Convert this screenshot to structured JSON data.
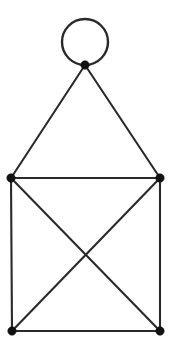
{
  "figure": {
    "width": 173,
    "height": 349,
    "background_color": "#ffffff",
    "edge_color": "#2a2a2a",
    "vertex_color": "#111111",
    "edge_stroke_width": 2.1,
    "vertex_radius": 4.2
  },
  "graph_data": {
    "type": "diagram",
    "directed": false,
    "has_self_loop": true,
    "vertex_count": 5,
    "edge_count": 9,
    "vertices": [
      {
        "id": "apex",
        "label": "",
        "x": 85,
        "y": 65,
        "degree": 4
      },
      {
        "id": "middle-left",
        "label": "",
        "x": 11,
        "y": 178,
        "degree": 4
      },
      {
        "id": "middle-right",
        "label": "",
        "x": 160,
        "y": 178,
        "degree": 4
      },
      {
        "id": "bottom-left",
        "label": "",
        "x": 12,
        "y": 331,
        "degree": 3
      },
      {
        "id": "bottom-right",
        "label": "",
        "x": 160,
        "y": 331,
        "degree": 3
      }
    ],
    "edges": [
      {
        "id": "edge-apex-middle-left",
        "from": "apex",
        "to": "middle-left",
        "x1": 85,
        "y1": 65,
        "x2": 11,
        "y2": 178
      },
      {
        "id": "edge-apex-middle-right",
        "from": "apex",
        "to": "middle-right",
        "x1": 85,
        "y1": 65,
        "x2": 160,
        "y2": 178
      },
      {
        "id": "edge-middle-left-middle-right",
        "from": "middle-left",
        "to": "middle-right",
        "x1": 11,
        "y1": 178,
        "x2": 160,
        "y2": 178
      },
      {
        "id": "edge-middle-left-bottom-left",
        "from": "middle-left",
        "to": "bottom-left",
        "x1": 11,
        "y1": 178,
        "x2": 12,
        "y2": 331
      },
      {
        "id": "edge-middle-right-bottom-right",
        "from": "middle-right",
        "to": "bottom-right",
        "x1": 160,
        "y1": 178,
        "x2": 160,
        "y2": 331
      },
      {
        "id": "edge-bottom-left-bottom-right",
        "from": "bottom-left",
        "to": "bottom-right",
        "x1": 12,
        "y1": 331,
        "x2": 160,
        "y2": 331
      },
      {
        "id": "edge-middle-left-bottom-right",
        "from": "middle-left",
        "to": "bottom-right",
        "x1": 11,
        "y1": 178,
        "x2": 160,
        "y2": 331
      },
      {
        "id": "edge-middle-right-bottom-left",
        "from": "middle-right",
        "to": "bottom-left",
        "x1": 160,
        "y1": 178,
        "x2": 12,
        "y2": 331
      }
    ],
    "self_loop": {
      "id": "self-loop-apex",
      "at": "apex",
      "center_x": 85,
      "center_y": 42,
      "radius": 23
    },
    "crossing_point": {
      "x": 86,
      "y": 254
    }
  }
}
